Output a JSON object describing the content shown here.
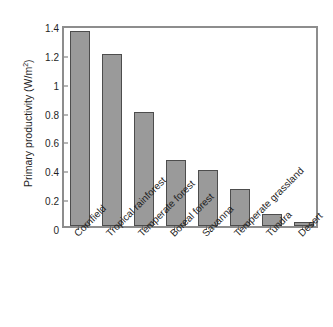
{
  "figure": {
    "caption_remnant": "",
    "background_color": "#ffffff"
  },
  "chart_data": {
    "type": "bar",
    "title": "",
    "xlabel": "",
    "ylabel": "Primary productivity (W/m",
    "ylabel_sup": "2",
    "ylabel_tail": ")",
    "ylabel_full": "Primary productivity (W/m2)",
    "categories": [
      "Cornfield",
      "Tropical rainforest",
      "Temperate forest",
      "Boreal forest",
      "Savanna",
      "Temperate grassland",
      "Tundra",
      "Desert"
    ],
    "values": [
      1.35,
      1.19,
      0.79,
      0.46,
      0.385,
      0.26,
      0.08,
      0.025
    ],
    "ylim": [
      0,
      1.4
    ],
    "yticks": [
      0,
      0.2,
      0.4,
      0.6,
      0.8,
      1,
      1.2,
      1.4
    ],
    "ytick_labels": [
      "0",
      "0.2",
      "0.4",
      "0.6",
      "0.8",
      "1",
      "1.2",
      "1.4"
    ],
    "grid": false,
    "legend": null,
    "bar_color": "#9a9a9a",
    "bar_edge_color": "#4d4d4d",
    "axis_color": "#8d8d8d"
  }
}
